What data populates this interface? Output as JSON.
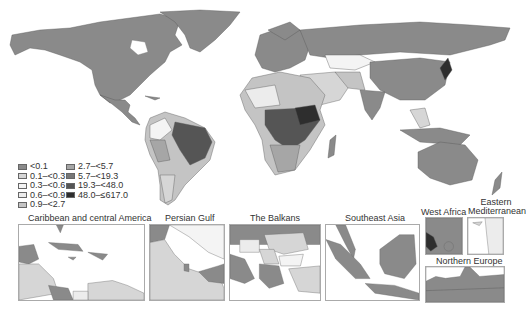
{
  "legend": {
    "items": [
      {
        "label": "<0.1",
        "color": "#8a8a8a"
      },
      {
        "label": "0.1–<0.3",
        "color": "#d6d6d6"
      },
      {
        "label": "0.3–<0.6",
        "color": "#f4f4f4"
      },
      {
        "label": "0.6–<0.9",
        "color": "#ececec"
      },
      {
        "label": "0.9–<2.7",
        "color": "#c4c4c4"
      },
      {
        "label": "2.7–<5.7",
        "color": "#a6a6a6"
      },
      {
        "label": "5.7–<19.3",
        "color": "#777777"
      },
      {
        "label": "19.3–<48.0",
        "color": "#555555"
      },
      {
        "label": "48.0–≤617.0",
        "color": "#2e2e2e"
      }
    ]
  },
  "insets": [
    {
      "title": "Caribbean and central America"
    },
    {
      "title": "Persian Gulf"
    },
    {
      "title": "The Balkans"
    },
    {
      "title": "Southeast Asia"
    },
    {
      "title": "West Africa"
    },
    {
      "title": "Eastern Mediterranean"
    },
    {
      "title": "Northern Europe"
    }
  ]
}
